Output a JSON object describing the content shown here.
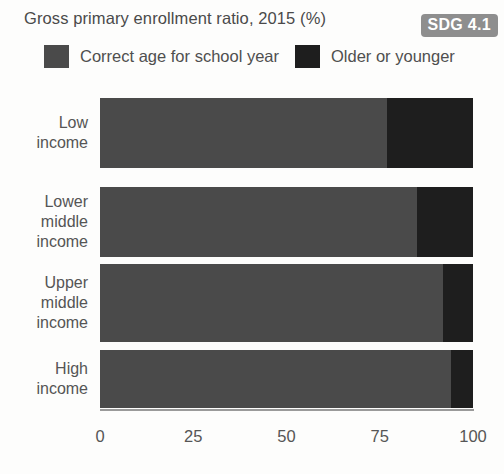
{
  "header": {
    "title": "Gross primary enrollment ratio, 2015 (%)",
    "badge": "SDG 4.1"
  },
  "legend": {
    "items": [
      {
        "label": "Correct age for school year",
        "color": "#4a4a4a",
        "swatch_name": "legend-swatch-correct-age"
      },
      {
        "label": "Older or younger",
        "color": "#1e1e1e",
        "swatch_name": "legend-swatch-older-younger"
      }
    ]
  },
  "colors": {
    "correct_age": "#4a4a4a",
    "older_or_younger": "#1e1e1e",
    "badge_background": "#8e8e8e",
    "badge_text": "#ffffff",
    "axis": "#9a9a9a",
    "text": "#4f4f4f",
    "background": "#fdfdfc"
  },
  "chart_data": {
    "type": "bar",
    "orientation": "horizontal",
    "stacked": true,
    "title": "Gross primary enrollment ratio, 2015 (%)",
    "xlabel": "",
    "ylabel": "",
    "xlim": [
      0,
      100
    ],
    "xticks": [
      0,
      25,
      50,
      75,
      100
    ],
    "xtick_labels": [
      "0",
      "25",
      "50",
      "75",
      "100"
    ],
    "grid": false,
    "legend_position": "top",
    "categories": [
      "Low\nincome",
      "Lower\nmiddle\nincome",
      "Upper\nmiddle\nincome",
      "High\nincome"
    ],
    "category_labels_flat": [
      "Low income",
      "Lower middle income",
      "Upper middle income",
      "High income"
    ],
    "series": [
      {
        "name": "Correct age for school year",
        "color": "#4a4a4a",
        "values": [
          77,
          85,
          92,
          94
        ]
      },
      {
        "name": "Older or younger",
        "color": "#1e1e1e",
        "values": [
          23,
          15,
          8,
          6
        ]
      }
    ],
    "totals": [
      100,
      100,
      100,
      100
    ]
  },
  "layout": {
    "plot_left_px": 100,
    "plot_right_px": 473,
    "rows": [
      {
        "top": 98,
        "height": 70
      },
      {
        "top": 187,
        "height": 70
      },
      {
        "top": 264,
        "height": 78
      },
      {
        "top": 350,
        "height": 58
      }
    ],
    "axis_y": 409,
    "tick_label_y": 427
  }
}
